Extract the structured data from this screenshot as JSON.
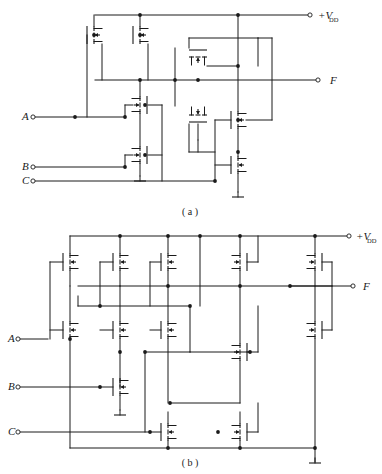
{
  "figure": {
    "type": "schematic",
    "width": 382,
    "height": 474,
    "line_color": "#1a1a1a",
    "background": "#ffffff"
  },
  "captions": [
    {
      "id": "cap-a",
      "text": "( a )",
      "x": 190,
      "y": 215
    },
    {
      "id": "cap-b",
      "text": "( b )",
      "x": 190,
      "y": 466
    }
  ],
  "panels": {
    "a": {
      "name": "circuit-a",
      "supply_label": {
        "main": "+V",
        "sub": "DD",
        "x": 318,
        "y": 19
      },
      "output_label": {
        "text": "F",
        "x": 330,
        "y": 84
      },
      "input_labels": [
        {
          "text": "A",
          "x": 22,
          "y": 120
        },
        {
          "text": "B",
          "x": 22,
          "y": 170
        },
        {
          "text": "C",
          "x": 22,
          "y": 184
        }
      ],
      "terminals": [
        {
          "name": "vdd-terminal",
          "x": 310,
          "y": 15
        },
        {
          "name": "output-terminal-f",
          "x": 318,
          "y": 80
        },
        {
          "name": "input-terminal-a",
          "x": 33,
          "y": 117
        },
        {
          "name": "input-terminal-b",
          "x": 33,
          "y": 167
        },
        {
          "name": "input-terminal-c",
          "x": 33,
          "y": 181
        }
      ]
    },
    "b": {
      "name": "circuit-b",
      "supply_label": {
        "main": "+V",
        "sub": "DD",
        "x": 356,
        "y": 240
      },
      "output_label": {
        "text": "F",
        "x": 363,
        "y": 290
      },
      "input_labels": [
        {
          "text": "A",
          "x": 8,
          "y": 342
        },
        {
          "text": "B",
          "x": 8,
          "y": 390
        },
        {
          "text": "C",
          "x": 8,
          "y": 435
        }
      ],
      "terminals": [
        {
          "name": "vdd-terminal",
          "x": 349,
          "y": 236
        },
        {
          "name": "output-terminal-f",
          "x": 353,
          "y": 286
        },
        {
          "name": "input-terminal-a",
          "x": 18,
          "y": 339
        },
        {
          "name": "input-terminal-b",
          "x": 18,
          "y": 387
        },
        {
          "name": "input-terminal-c",
          "x": 18,
          "y": 432
        }
      ]
    }
  },
  "netlist_a": {
    "rails": [
      {
        "name": "vdd-rail",
        "x1": 95,
        "y1": 15,
        "x2": 310,
        "y2": 15
      },
      {
        "name": "output-rail-f",
        "x1": 95,
        "y1": 80,
        "x2": 318,
        "y2": 80
      },
      {
        "name": "input-rail-a",
        "x1": 33,
        "y1": 117,
        "x2": 125,
        "y2": 117
      },
      {
        "name": "input-rail-b",
        "x1": 33,
        "y1": 167,
        "x2": 125,
        "y2": 167
      },
      {
        "name": "input-rail-c",
        "x1": 33,
        "y1": 181,
        "x2": 215,
        "y2": 181
      }
    ],
    "junction_dots": [
      {
        "x": 140,
        "y": 15
      },
      {
        "x": 238,
        "y": 15
      },
      {
        "x": 140,
        "y": 80
      },
      {
        "x": 175,
        "y": 80
      },
      {
        "x": 198,
        "y": 80
      },
      {
        "x": 75,
        "y": 117
      },
      {
        "x": 125,
        "y": 117
      },
      {
        "x": 145,
        "y": 105
      },
      {
        "x": 125,
        "y": 167
      },
      {
        "x": 145,
        "y": 155
      },
      {
        "x": 215,
        "y": 181
      },
      {
        "x": 238,
        "y": 66
      },
      {
        "x": 238,
        "y": 120
      },
      {
        "x": 94,
        "y": 35
      },
      {
        "x": 140,
        "y": 35
      },
      {
        "x": 238,
        "y": 152
      }
    ]
  },
  "netlist_b": {
    "rails": [
      {
        "name": "vdd-rail",
        "x1": 70,
        "y1": 236,
        "x2": 349,
        "y2": 236
      },
      {
        "name": "output-rail-f",
        "x1": 120,
        "y1": 286,
        "x2": 353,
        "y2": 286
      },
      {
        "name": "gnd-rail",
        "x1": 70,
        "y1": 448,
        "x2": 315,
        "y2": 448
      },
      {
        "name": "input-rail-a",
        "x1": 18,
        "y1": 339,
        "x2": 48,
        "y2": 339
      },
      {
        "name": "input-rail-b",
        "x1": 18,
        "y1": 387,
        "x2": 100,
        "y2": 387
      },
      {
        "name": "input-rail-c",
        "x1": 18,
        "y1": 432,
        "x2": 150,
        "y2": 432
      }
    ],
    "junction_dots": [
      {
        "x": 120,
        "y": 236
      },
      {
        "x": 168,
        "y": 236
      },
      {
        "x": 200,
        "y": 236
      },
      {
        "x": 240,
        "y": 236
      },
      {
        "x": 315,
        "y": 236
      },
      {
        "x": 168,
        "y": 286
      },
      {
        "x": 240,
        "y": 286
      },
      {
        "x": 290,
        "y": 286
      },
      {
        "x": 100,
        "y": 306
      },
      {
        "x": 190,
        "y": 306
      },
      {
        "x": 120,
        "y": 352
      },
      {
        "x": 145,
        "y": 352
      },
      {
        "x": 100,
        "y": 387
      },
      {
        "x": 250,
        "y": 352
      },
      {
        "x": 150,
        "y": 432
      },
      {
        "x": 218,
        "y": 432
      },
      {
        "x": 70,
        "y": 339
      },
      {
        "x": 168,
        "y": 448
      },
      {
        "x": 240,
        "y": 448
      },
      {
        "x": 315,
        "y": 448
      },
      {
        "x": 170,
        "y": 403
      }
    ]
  },
  "devices": {
    "legend": "MOSFET symbol: vertical gate bar, segmented channel bar, bulk arrow",
    "panel_a_count": 9,
    "panel_b_count": 14
  }
}
